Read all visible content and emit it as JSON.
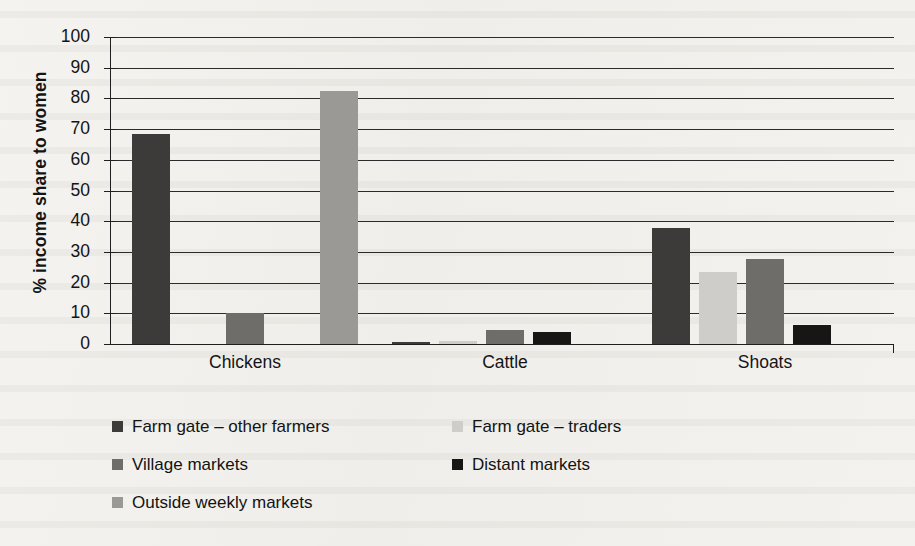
{
  "chart_data": {
    "type": "bar",
    "title": "",
    "subtitle": "",
    "xlabel": "",
    "ylabel": "% income share to women",
    "ylim": [
      0,
      100
    ],
    "ytick_step": 10,
    "ytick_labels": [
      "100",
      "90",
      "80",
      "70",
      "60",
      "50",
      "40",
      "30",
      "20",
      "10",
      "0"
    ],
    "grid": true,
    "grid_axis": "y",
    "legend_position": "bottom-left",
    "categories": [
      "Chickens",
      "Cattle",
      "Shoats"
    ],
    "series": [
      {
        "name": "Farm gate – other farmers",
        "color": "#3d3b39",
        "values": [
          68.5,
          0.5,
          37.8
        ]
      },
      {
        "name": "Farm gate – traders",
        "color": "#cecdc9",
        "values": [
          0,
          1.0,
          23.5
        ]
      },
      {
        "name": "Village markets",
        "color": "#6f6d6a",
        "values": [
          10.0,
          4.6,
          27.8
        ]
      },
      {
        "name": "Distant markets",
        "color": "#171615",
        "values": [
          0,
          4.0,
          6.2
        ]
      },
      {
        "name": "Outside weekly markets",
        "color": "#9b9995",
        "values": [
          82.3,
          0,
          0
        ]
      }
    ]
  },
  "legend": {
    "entries": [
      {
        "label": "Farm gate – other farmers",
        "color": "#3d3b39"
      },
      {
        "label": "Farm gate – traders",
        "color": "#cecdc9"
      },
      {
        "label": "Village markets",
        "color": "#6f6d6a"
      },
      {
        "label": "Distant markets",
        "color": "#171615"
      },
      {
        "label": "Outside weekly markets",
        "color": "#9b9995"
      }
    ]
  },
  "axes": {
    "y_title": "% income share to women"
  }
}
